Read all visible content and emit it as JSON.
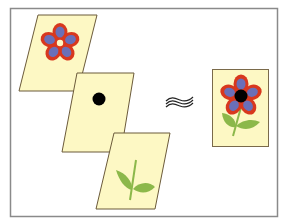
{
  "diagram": {
    "colors": {
      "frame": "#8a8a8a",
      "sheet_fill": "#fdf8c4",
      "sheet_stroke": "#6b5a3a",
      "petal_outer": "#d8381e",
      "petal_inner": "#6a6fb8",
      "center": "#000000",
      "leaf": "#8cb84a"
    },
    "layers": [
      {
        "name": "petals-layer",
        "content": "petals"
      },
      {
        "name": "center-layer",
        "content": "black center dot"
      },
      {
        "name": "stem-layer",
        "content": "stem and leaves"
      }
    ],
    "operator": {
      "symbol": "≈",
      "meaning": "approximately equals"
    },
    "result": {
      "name": "composite-flower",
      "content": "complete flower"
    }
  }
}
